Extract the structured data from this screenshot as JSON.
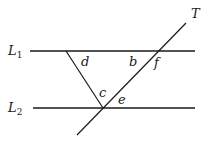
{
  "diagram": {
    "lines": {
      "L1": {
        "label": "L",
        "subscript": "1"
      },
      "L2": {
        "label": "L",
        "subscript": "2"
      },
      "T": {
        "label": "T"
      }
    },
    "angles": {
      "b": "b",
      "c": "c",
      "d": "d",
      "e": "e",
      "f": "f"
    },
    "colors": {
      "stroke": "#1a1a1a",
      "background": "#ffffff"
    }
  }
}
